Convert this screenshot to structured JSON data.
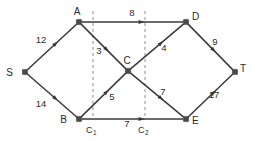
{
  "chart_data": {
    "type": "diagram",
    "title": "",
    "diagram_kind": "flow-network",
    "nodes": [
      {
        "id": "S",
        "label": "S",
        "x": 25,
        "y": 72,
        "label_dx": -12,
        "label_dy": 4,
        "role": "source"
      },
      {
        "id": "A",
        "label": "A",
        "x": 79,
        "y": 22,
        "label_dx": -2,
        "label_dy": -7,
        "role": "intermediate"
      },
      {
        "id": "B",
        "label": "B",
        "x": 79,
        "y": 119,
        "label_dx": -12,
        "label_dy": 4,
        "role": "intermediate"
      },
      {
        "id": "C",
        "label": "C",
        "x": 128,
        "y": 71,
        "label_dx": -1,
        "label_dy": -7,
        "role": "intermediate"
      },
      {
        "id": "D",
        "label": "D",
        "x": 186,
        "y": 22,
        "label_dx": 6,
        "label_dy": -2,
        "role": "intermediate"
      },
      {
        "id": "E",
        "label": "E",
        "x": 186,
        "y": 119,
        "label_dx": 6,
        "label_dy": 5,
        "role": "intermediate"
      },
      {
        "id": "T",
        "label": "T",
        "x": 235,
        "y": 72,
        "label_dx": 5,
        "label_dy": 0,
        "role": "sink"
      }
    ],
    "edges": [
      {
        "from": "S",
        "to": "A",
        "capacity": 12,
        "label": "12",
        "label_x": 41,
        "label_y": 43,
        "directed": true
      },
      {
        "from": "S",
        "to": "B",
        "capacity": 14,
        "label": "14",
        "label_x": 41,
        "label_y": 107,
        "directed": true
      },
      {
        "from": "A",
        "to": "D",
        "capacity": 8,
        "label": "8",
        "label_x": 132,
        "label_y": 16,
        "directed": true
      },
      {
        "from": "A",
        "to": "C",
        "capacity": 3,
        "label": "3",
        "label_x": 99,
        "label_y": 54,
        "directed": true
      },
      {
        "from": "B",
        "to": "C",
        "capacity": 5,
        "label": "5",
        "label_x": 112,
        "label_y": 100,
        "directed": true
      },
      {
        "from": "B",
        "to": "E",
        "capacity": 7,
        "label": "7",
        "label_x": 127,
        "label_y": 127,
        "directed": true
      },
      {
        "from": "C",
        "to": "D",
        "capacity": 4,
        "label": "4",
        "label_x": 164,
        "label_y": 51,
        "directed": true
      },
      {
        "from": "C",
        "to": "E",
        "capacity": 7,
        "label": "7",
        "label_x": 163,
        "label_y": 95,
        "directed": true
      },
      {
        "from": "D",
        "to": "T",
        "capacity": 9,
        "label": "9",
        "label_x": 215,
        "label_y": 45,
        "directed": true
      },
      {
        "from": "E",
        "to": "T",
        "capacity": 17,
        "label": "17",
        "label_x": 214,
        "label_y": 98,
        "directed": true
      }
    ],
    "cuts": [
      {
        "id": "C1",
        "label": "C",
        "subscript": "1",
        "x": 93,
        "y_top": 11,
        "y_bottom": 116,
        "label_x": 86,
        "label_y": 133
      },
      {
        "id": "C2",
        "label": "C",
        "subscript": "2",
        "x": 145,
        "y_top": 11,
        "y_bottom": 116,
        "label_x": 138,
        "label_y": 133
      }
    ],
    "colors": {
      "edge": "#3a3a3a",
      "node": "#4a4a4a",
      "cut": "#9a9a9a",
      "text": "#2b2b2b",
      "background": "#ffffff"
    }
  }
}
